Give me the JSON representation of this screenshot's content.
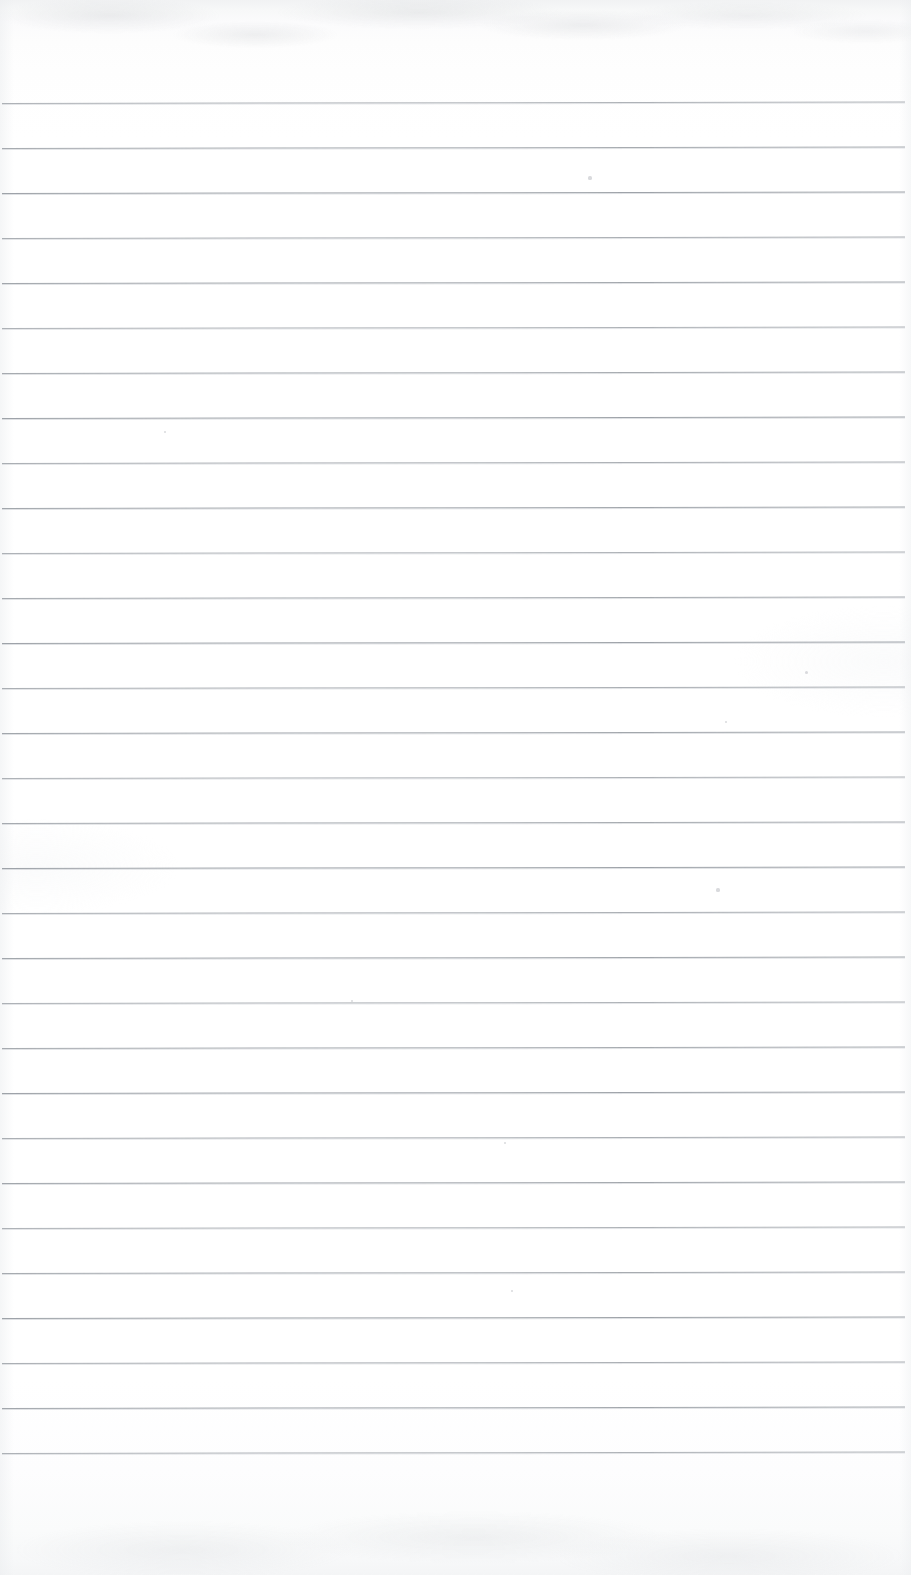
{
  "document": {
    "type": "lined-notebook-paper-scan",
    "title": "Blank ruled notebook page",
    "page_width": 911,
    "page_height": 1575,
    "paper_color": "#fdfdfe",
    "rule_color": "#9ba0a6",
    "text_content": "",
    "visible_text": []
  },
  "ruling": {
    "line_count": 31,
    "first_line_y": 103,
    "line_spacing": 45,
    "line_left_x": 2,
    "line_right_x": 905,
    "line_thickness": 1,
    "slant_px": -1.5,
    "top_margin_label": "blank header area above first rule",
    "bottom_margin_label": "blank footer area below last rule"
  },
  "scan_artifacts": {
    "top_edge_shading": "#eceef0",
    "bottom_edge_shading": "#f4f5f6",
    "grain_opacity": 0.55,
    "specks": [
      {
        "x": 590,
        "y": 178,
        "r": 1.6
      },
      {
        "x": 806,
        "y": 672,
        "r": 1.5
      },
      {
        "x": 726,
        "y": 722,
        "r": 1.2
      },
      {
        "x": 718,
        "y": 890,
        "r": 1.6
      },
      {
        "x": 505,
        "y": 1143,
        "r": 1.3
      },
      {
        "x": 512,
        "y": 1291,
        "r": 1.4
      },
      {
        "x": 165,
        "y": 432,
        "r": 1.1
      },
      {
        "x": 352,
        "y": 1001,
        "r": 1.1
      }
    ]
  }
}
